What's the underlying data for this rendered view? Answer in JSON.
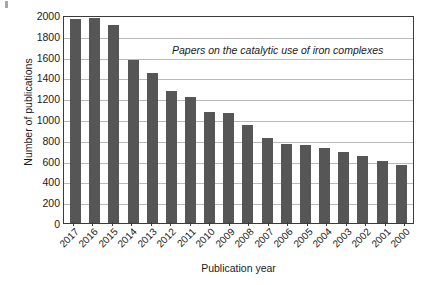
{
  "chart_data": {
    "type": "bar",
    "title": "",
    "annotation": "Papers on the catalytic use of iron complexes",
    "xlabel": "Publication year",
    "ylabel": "Number of publications",
    "categories": [
      "2017",
      "2016",
      "2015",
      "2014",
      "2013",
      "2012",
      "2011",
      "2010",
      "2009",
      "2008",
      "2007",
      "2006",
      "2005",
      "2004",
      "2003",
      "2002",
      "2001",
      "2000"
    ],
    "values": [
      1960,
      1975,
      1900,
      1565,
      1445,
      1265,
      1210,
      1065,
      1055,
      940,
      815,
      755,
      750,
      725,
      680,
      645,
      600,
      555
    ],
    "ylim": [
      0,
      2000
    ],
    "yticks": [
      0,
      200,
      400,
      600,
      800,
      1000,
      1200,
      1400,
      1600,
      1800,
      2000
    ],
    "ytick_labels": [
      "0",
      "200",
      "400",
      "600",
      "800",
      "1000",
      "1200",
      "1400",
      "1600",
      "1800",
      "2000"
    ],
    "grid": true,
    "legend": "none",
    "bar_color": "#565656",
    "grid_color": "#b9b9b9",
    "frame_color": "#3b3b3b",
    "text_color": "#1a1a1a"
  }
}
